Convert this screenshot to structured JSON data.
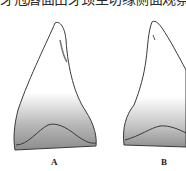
{
  "caption_fragment": "牙冠唇面由牙颈至切缘侧面观察",
  "figures": [
    {
      "label": "A",
      "description": "tooth crown labial view, left",
      "icon": "tooth-drawing"
    },
    {
      "label": "B",
      "description": "tooth crown labial view, right (partially cropped)",
      "icon": "tooth-drawing"
    }
  ],
  "colors": {
    "line": "#3a3a3a",
    "shade": "#9a9a9a",
    "background": "#ffffff"
  }
}
